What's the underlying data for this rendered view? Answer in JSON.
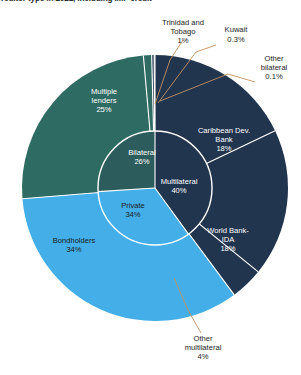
{
  "title": {
    "text": "reditor type in 2021, including IMF credit",
    "clipped": true
  },
  "colors": {
    "multilateral": "#22354f",
    "private": "#43aee8",
    "bilateral": "#2c5c5c",
    "bilateral_outer": "#2e6b63",
    "separator": "#ffffff",
    "leader_line": "#c4915e",
    "background": "#ffffff",
    "label_on_dark": "#ffffff",
    "label_on_light": "#1c1c1c"
  },
  "chart_data": {
    "type": "pie",
    "title": "reditor type in 2021, including IMF credit",
    "variant": "nested-donut-sunburst",
    "center": [
      155,
      188
    ],
    "inner_radius": 57,
    "outer_radius": 133,
    "start_angle_deg": -90,
    "direction": "clockwise",
    "inner_ring": {
      "name": "Creditor category",
      "slices": [
        {
          "label": "Multilateral",
          "value": 40,
          "display": "40%",
          "color": "#22354f",
          "text_color": "#ffffff"
        },
        {
          "label": "Private",
          "value": 34,
          "display": "34%",
          "color": "#43aee8",
          "text_color": "#1c1c1c"
        },
        {
          "label": "Bilateral",
          "value": 26,
          "display": "26%",
          "color": "#2c5c5c",
          "text_color": "#ffffff"
        }
      ]
    },
    "outer_ring": {
      "name": "Individual creditor",
      "slices": [
        {
          "label": "Caribbean Dev. Bank",
          "value": 18,
          "display": "18%",
          "color": "#22354f",
          "parent": "Multilateral",
          "label_placement": "inside",
          "text_color": "#ffffff"
        },
        {
          "label": "World Bank-IDA",
          "value": 18,
          "display": "18%",
          "color": "#22354f",
          "parent": "Multilateral",
          "label_placement": "inside",
          "text_color": "#ffffff"
        },
        {
          "label": "Other multilateral",
          "value": 4,
          "display": "4%",
          "color": "#22354f",
          "parent": "Multilateral",
          "label_placement": "callout",
          "text_color": "#1c1c1c"
        },
        {
          "label": "Bondholders",
          "value": 34,
          "display": "34%",
          "color": "#43aee8",
          "parent": "Private",
          "label_placement": "inside",
          "text_color": "#1c1c1c"
        },
        {
          "label": "Multiple lenders",
          "value": 25,
          "display": "25%",
          "color": "#2e6b63",
          "parent": "Bilateral",
          "label_placement": "inside",
          "text_color": "#ffffff"
        },
        {
          "label": "Trinidad and Tobago",
          "value": 1,
          "display": "1%",
          "color": "#2e6b63",
          "parent": "Bilateral",
          "label_placement": "callout",
          "text_color": "#1c1c1c"
        },
        {
          "label": "Kuwait",
          "value": 0.3,
          "display": "0.3%",
          "color": "#22354f",
          "parent": "Bilateral",
          "label_placement": "callout",
          "text_color": "#1c1c1c"
        },
        {
          "label": "Other bilateral",
          "value": 0.1,
          "display": "0.1%",
          "color": "#22354f",
          "parent": "Bilateral",
          "label_placement": "callout",
          "text_color": "#1c1c1c"
        }
      ]
    },
    "legend": "none",
    "grid": false,
    "xlabel": "",
    "ylabel": ""
  },
  "labels": {
    "inner": {
      "multilateral_name": "Multilateral",
      "multilateral_pct": "40%",
      "private_name": "Private",
      "private_pct": "34%",
      "bilateral_name": "Bilateral",
      "bilateral_pct": "26%"
    },
    "outer": {
      "cdb_line1": "Caribbean Dev.",
      "cdb_line2": "Bank",
      "cdb_pct": "18%",
      "wb_line1": "World Bank-",
      "wb_line2": "IDA",
      "wb_pct": "18%",
      "bondholders_name": "Bondholders",
      "bondholders_pct": "34%",
      "multiple_line1": "Multiple",
      "multiple_line2": "lenders",
      "multiple_pct": "25%"
    },
    "callouts": {
      "trinidad_line1": "Trinidad and",
      "trinidad_line2": "Tobago",
      "trinidad_pct": "1%",
      "kuwait_name": "Kuwait",
      "kuwait_pct": "0.3%",
      "other_bilateral_line1": "Other",
      "other_bilateral_line2": "bilateral",
      "other_bilateral_pct": "0.1%",
      "other_multi_line1": "Other",
      "other_multi_line2": "multilateral",
      "other_multi_pct": "4%"
    }
  }
}
